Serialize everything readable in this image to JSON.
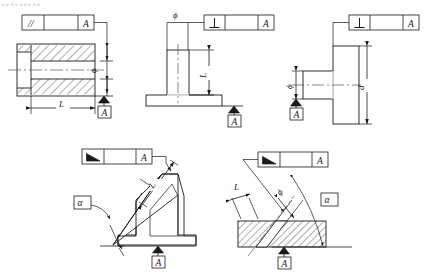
{
  "page": {
    "header_fragment": "。。。。。。。。。",
    "background": "#ffffff",
    "line_color": "#1a1a1a",
    "hatch_color": "#1a1a1a",
    "center_line_color": "#555555"
  },
  "symbols": {
    "parallelism": "//",
    "perpendicularity": "⊥",
    "angularity": "∠",
    "diameter": "ϕ",
    "datum_letter": "A",
    "angle_alpha": "α",
    "length_L": "L",
    "diameter_d": "d"
  },
  "figures": [
    {
      "id": "fig-parallelism-bore",
      "name": "parallelism-of-bore-axis",
      "control_frame": {
        "symbol": "//",
        "symbol_name": "parallelism-symbol",
        "tolerance": "",
        "datum": "A"
      },
      "datum_label": "A",
      "dimensions": [
        {
          "name": "bore-diameter",
          "label": "ϕ"
        },
        {
          "name": "length",
          "label": "L"
        }
      ]
    },
    {
      "id": "fig-perpendicularity-boss",
      "name": "perpendicularity-of-boss-axis",
      "control_frame": {
        "symbol": "⊥",
        "symbol_name": "perpendicularity-symbol",
        "tolerance": "",
        "datum": "A"
      },
      "datum_label": "A",
      "dimensions": [
        {
          "name": "boss-diameter",
          "label": "ϕ"
        },
        {
          "name": "boss-height",
          "label": "L"
        }
      ]
    },
    {
      "id": "fig-perpendicularity-shaft",
      "name": "perpendicularity-of-shaft-face",
      "control_frame": {
        "symbol": "⊥",
        "symbol_name": "perpendicularity-symbol",
        "tolerance": "",
        "datum": "A"
      },
      "datum_label": "A",
      "dimensions": [
        {
          "name": "shaft-diameter",
          "label": "ϕ"
        },
        {
          "name": "flange-diameter",
          "label": "d"
        }
      ]
    },
    {
      "id": "fig-angularity-bracket",
      "name": "angularity-of-inclined-face",
      "control_frame": {
        "symbol": "∠",
        "symbol_name": "angularity-symbol",
        "tolerance": "",
        "datum": "A"
      },
      "datum_label": "A",
      "angle_label": "α",
      "dimensions": [
        {
          "name": "inclined-length",
          "label": "L"
        }
      ]
    },
    {
      "id": "fig-angularity-hole",
      "name": "angularity-of-inclined-hole-axis",
      "control_frame": {
        "symbol": "∠",
        "symbol_name": "angularity-symbol",
        "tolerance": "",
        "datum": "A"
      },
      "datum_label": "A",
      "angle_label": "α",
      "dimensions": [
        {
          "name": "hole-diameter",
          "label": "ϕ"
        },
        {
          "name": "offset-length",
          "label": "L"
        }
      ]
    }
  ]
}
